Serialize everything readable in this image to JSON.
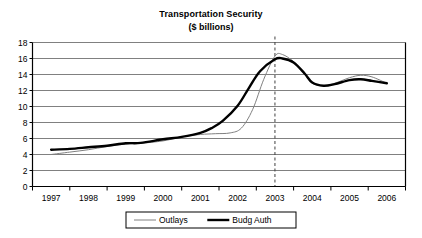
{
  "chart_data": {
    "type": "line",
    "title": "Transportation Security",
    "subtitle": "($ billions)",
    "xlabel": "",
    "ylabel": "",
    "ylim": [
      0,
      18
    ],
    "ytick_values": [
      0,
      2,
      4,
      6,
      8,
      10,
      12,
      14,
      16,
      18
    ],
    "ytick_labels": [
      "0",
      "2",
      "4",
      "6",
      "8",
      "10",
      "12",
      "14",
      "16",
      "18"
    ],
    "categories": [
      "1997",
      "1998",
      "1999",
      "2000",
      "2001",
      "2002",
      "2003",
      "2004",
      "2005",
      "2006"
    ],
    "grid": "horizontal",
    "legend_position": "bottom",
    "annotation_vline_at": "2003",
    "annotation_vline_style": "dashed",
    "series": [
      {
        "name": "Outlays",
        "color": "#808080",
        "width": 1,
        "values": [
          4.0,
          4.6,
          5.3,
          5.7,
          6.5,
          6.7,
          16.4,
          12.6,
          13.9,
          12.9
        ],
        "points": [
          [
            1997.0,
            4.0
          ],
          [
            1997.5,
            4.3
          ],
          [
            1998.0,
            4.6
          ],
          [
            1998.5,
            5.0
          ],
          [
            1999.0,
            5.3
          ],
          [
            1999.4,
            5.4
          ],
          [
            2000.0,
            5.7
          ],
          [
            2000.5,
            6.2
          ],
          [
            2001.0,
            6.5
          ],
          [
            2001.4,
            6.6
          ],
          [
            2001.8,
            6.7
          ],
          [
            2002.1,
            7.3
          ],
          [
            2002.4,
            9.6
          ],
          [
            2002.7,
            13.4
          ],
          [
            2003.0,
            16.3
          ],
          [
            2003.2,
            16.5
          ],
          [
            2003.5,
            15.6
          ],
          [
            2003.8,
            14.0
          ],
          [
            2004.0,
            12.9
          ],
          [
            2004.3,
            12.6
          ],
          [
            2004.6,
            12.9
          ],
          [
            2005.0,
            13.6
          ],
          [
            2005.3,
            13.9
          ],
          [
            2005.6,
            13.7
          ],
          [
            2006.0,
            12.9
          ]
        ]
      },
      {
        "name": "Budg Auth",
        "color": "#000000",
        "width": 2.4,
        "values": [
          4.6,
          4.8,
          5.4,
          5.9,
          6.6,
          8.2,
          16.0,
          12.6,
          13.4,
          12.9
        ],
        "points": [
          [
            1997.0,
            4.6
          ],
          [
            1997.5,
            4.7
          ],
          [
            1998.0,
            4.9
          ],
          [
            1998.5,
            5.1
          ],
          [
            1999.0,
            5.4
          ],
          [
            1999.4,
            5.45
          ],
          [
            2000.0,
            5.9
          ],
          [
            2000.5,
            6.2
          ],
          [
            2001.0,
            6.7
          ],
          [
            2001.3,
            7.3
          ],
          [
            2001.6,
            8.2
          ],
          [
            2002.0,
            10.1
          ],
          [
            2002.3,
            12.3
          ],
          [
            2002.6,
            14.4
          ],
          [
            2003.0,
            15.9
          ],
          [
            2003.2,
            16.0
          ],
          [
            2003.5,
            15.5
          ],
          [
            2003.8,
            14.1
          ],
          [
            2004.0,
            13.0
          ],
          [
            2004.3,
            12.6
          ],
          [
            2004.6,
            12.8
          ],
          [
            2005.0,
            13.3
          ],
          [
            2005.3,
            13.4
          ],
          [
            2005.6,
            13.2
          ],
          [
            2006.0,
            12.9
          ]
        ]
      }
    ]
  },
  "legend": {
    "items": [
      {
        "label": "Outlays",
        "marker": "thin-line-marker"
      },
      {
        "label": "Budg Auth",
        "marker": "thick-line-marker"
      }
    ]
  },
  "colors": {
    "axis": "#000000",
    "gridline": "#808080",
    "outlays": "#808080",
    "budg_auth": "#000000",
    "vline": "#404040",
    "background": "#ffffff"
  }
}
